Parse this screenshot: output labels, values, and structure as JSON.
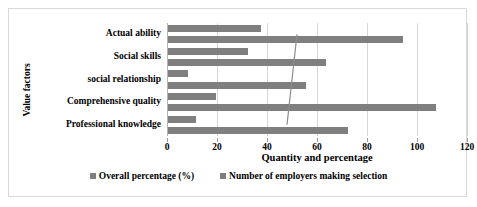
{
  "chart_data": {
    "type": "bar",
    "orientation": "horizontal",
    "title": "",
    "xlabel": "Quantity and percentage",
    "ylabel": "Value factors",
    "xlim": [
      0,
      120
    ],
    "xticks": [
      0,
      20,
      40,
      60,
      80,
      100,
      120
    ],
    "grid": true,
    "legend_position": "bottom",
    "categories": [
      "Actual ability",
      "Social skills",
      "social relationship",
      "Comprehensive quality",
      "Professional knowledge"
    ],
    "series": [
      {
        "name": "Overall percentage (%)",
        "color": "#7f7f7f",
        "values": [
          37,
          32,
          8,
          19,
          11
        ]
      },
      {
        "name": "Number of employers making selection",
        "color": "#7f7f7f",
        "values": [
          94,
          63,
          55,
          107,
          72
        ]
      }
    ],
    "overlay_line": {
      "name": "trend",
      "color": "#8c8c8c",
      "values": [
        52,
        51,
        50,
        49,
        48
      ]
    }
  },
  "axis": {
    "y_title": "Value factors",
    "x_title": "Quantity and percentage"
  }
}
